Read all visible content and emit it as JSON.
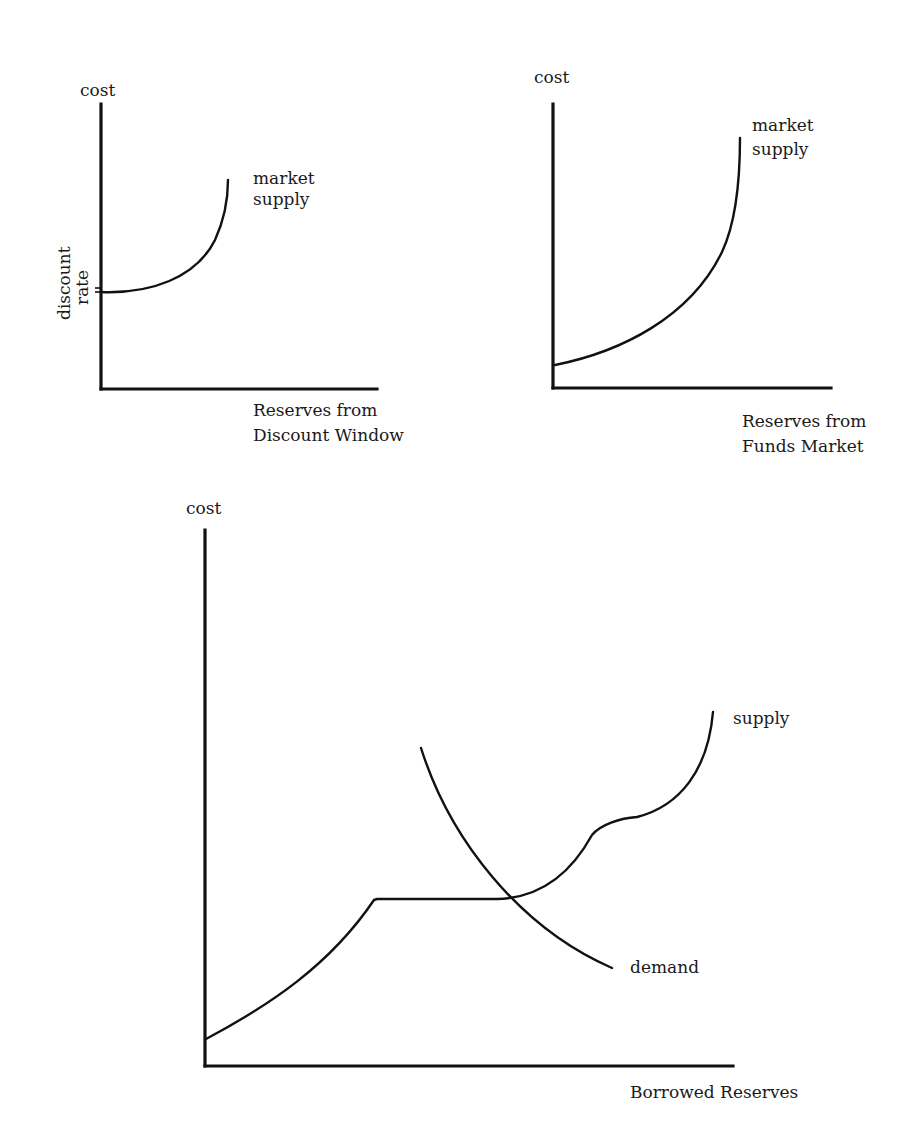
{
  "panels": {
    "discount_window": {
      "y_label": "cost",
      "y_tick_label_line1": "discount",
      "y_tick_label_line2": "rate",
      "curve_label_line1": "market",
      "curve_label_line2": "supply",
      "x_label_line1": "Reserves from",
      "x_label_line2": "Discount Window"
    },
    "funds_market": {
      "y_label": "cost",
      "curve_label_line1": "market",
      "curve_label_line2": "supply",
      "x_label_line1": "Reserves from",
      "x_label_line2": "Funds Market"
    },
    "borrowed_reserves": {
      "y_label": "cost",
      "supply_label": "supply",
      "demand_label": "demand",
      "x_label": "Borrowed Reserves"
    }
  },
  "colors": {
    "ink": "#111111",
    "background": "#ffffff"
  }
}
